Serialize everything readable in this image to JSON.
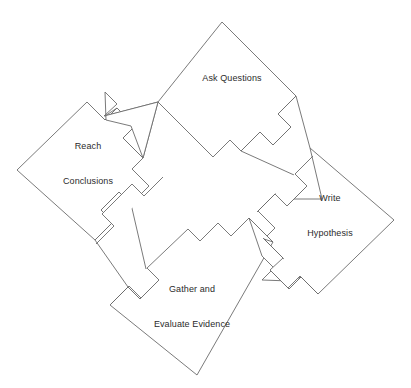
{
  "diagram": {
    "type": "cycle-flowchart",
    "background_color": "#ffffff",
    "stroke_color": "#6b6b6b",
    "text_color": "#2b2b2b",
    "nodes": [
      {
        "id": "ask-questions",
        "label": "Ask Questions",
        "label_lines": [
          "Ask Questions"
        ],
        "position": "top",
        "center_x": 232,
        "center_y": 80,
        "radius": 74
      },
      {
        "id": "write-hypothesis",
        "label": "Write Hypothesis",
        "label_lines": [
          "Write",
          "Hypothesis"
        ],
        "position": "right",
        "center_x": 321,
        "center_y": 215,
        "radius": 74
      },
      {
        "id": "gather-and-evaluate-evidence",
        "label": "Gather and Evaluate Evidence",
        "label_lines": [
          "Gather and",
          "Evaluate Evidence"
        ],
        "position": "bottom",
        "center_x": 188,
        "center_y": 303,
        "radius": 74
      },
      {
        "id": "reach-conclusions",
        "label": "Reach Conclusions",
        "label_lines": [
          "Reach",
          "Conclusions"
        ],
        "position": "left",
        "center_x": 91,
        "center_y": 170,
        "radius": 74
      }
    ],
    "arrows": [
      {
        "id": "arrow-ask-questions-to-write-hypothesis",
        "from": "ask-questions",
        "to": "write-hypothesis",
        "direction": "down-right"
      },
      {
        "id": "arrow-write-hypothesis-to-gather-evidence",
        "from": "write-hypothesis",
        "to": "gather-and-evaluate-evidence",
        "direction": "down-left"
      },
      {
        "id": "arrow-gather-evidence-to-reach-conclusions",
        "from": "gather-and-evaluate-evidence",
        "to": "reach-conclusions",
        "direction": "up-left"
      },
      {
        "id": "arrow-reach-conclusions-to-ask-questions",
        "from": "reach-conclusions",
        "to": "ask-questions",
        "direction": "up-right"
      }
    ]
  }
}
